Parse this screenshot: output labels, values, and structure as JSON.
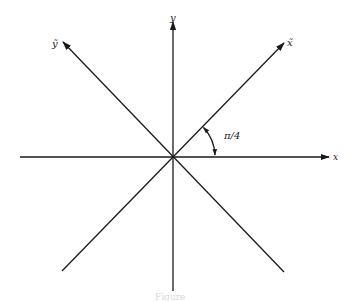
{
  "diagram": {
    "type": "coordinate-rotation",
    "origin": [
      173,
      157
    ],
    "axes": [
      {
        "id": "x",
        "label": "x",
        "from": [
          20,
          157
        ],
        "to": [
          330,
          157
        ],
        "arrow": true
      },
      {
        "id": "y",
        "label": "y",
        "from": [
          173,
          291
        ],
        "to": [
          173,
          22
        ],
        "arrow": true
      },
      {
        "id": "x-tilde",
        "label": "x̃",
        "from": [
          62,
          271
        ],
        "to": [
          284,
          43
        ],
        "arrow": true
      },
      {
        "id": "y-tilde",
        "label": "ỹ",
        "from": [
          284,
          272
        ],
        "to": [
          63,
          42
        ],
        "arrow": true
      }
    ],
    "angle": {
      "label": "π/4",
      "radius": 42,
      "from_deg": 0,
      "to_deg": 45
    },
    "labels": {
      "x": "x",
      "y": "y",
      "x_tilde": "x̃",
      "y_tilde": "ỹ",
      "angle": "π/4"
    },
    "caption": "Figure"
  }
}
